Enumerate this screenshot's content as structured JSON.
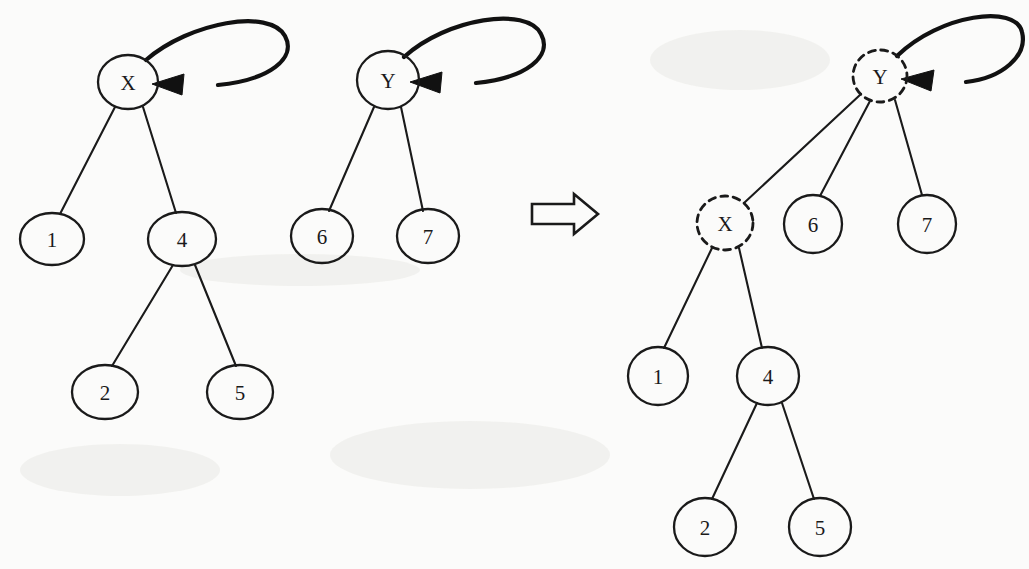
{
  "figure": {
    "background_color": "#fbfbfa",
    "ink_color": "#1a1a1a",
    "transform_symbol": "double-right-arrow"
  },
  "before": {
    "tree_x": {
      "root": "X",
      "root_has_self_loop": true,
      "nodes": [
        {
          "id": "X",
          "label": "X",
          "cx": 128,
          "cy": 82,
          "rx": 30,
          "ry": 27,
          "style": "solid",
          "self_loop": true
        },
        {
          "id": "L1",
          "label": "1",
          "cx": 52,
          "cy": 239,
          "rx": 32,
          "ry": 26,
          "style": "solid",
          "self_loop": false
        },
        {
          "id": "L4",
          "label": "4",
          "cx": 182,
          "cy": 239,
          "rx": 34,
          "ry": 27,
          "style": "solid",
          "self_loop": false
        },
        {
          "id": "L2",
          "label": "2",
          "cx": 105,
          "cy": 392,
          "rx": 33,
          "ry": 27,
          "style": "solid",
          "self_loop": false
        },
        {
          "id": "L5",
          "label": "5",
          "cx": 240,
          "cy": 392,
          "rx": 33,
          "ry": 27,
          "style": "solid",
          "self_loop": false
        }
      ],
      "edges": [
        {
          "from": "X",
          "to": "L1"
        },
        {
          "from": "X",
          "to": "L4"
        },
        {
          "from": "L4",
          "to": "L2"
        },
        {
          "from": "L4",
          "to": "L5"
        }
      ]
    },
    "tree_y": {
      "root": "Y",
      "root_has_self_loop": true,
      "nodes": [
        {
          "id": "Y",
          "label": "Y",
          "cx": 388,
          "cy": 80,
          "rx": 31,
          "ry": 29,
          "style": "solid",
          "self_loop": true
        },
        {
          "id": "L6",
          "label": "6",
          "cx": 322,
          "cy": 236,
          "rx": 31,
          "ry": 27,
          "style": "solid",
          "self_loop": false
        },
        {
          "id": "L7",
          "label": "7",
          "cx": 428,
          "cy": 236,
          "rx": 31,
          "ry": 27,
          "style": "solid",
          "self_loop": false
        }
      ],
      "edges": [
        {
          "from": "Y",
          "to": "L6"
        },
        {
          "from": "Y",
          "to": "L7"
        }
      ]
    }
  },
  "after": {
    "tree_merged": {
      "root": "Y",
      "root_has_self_loop": true,
      "nodes": [
        {
          "id": "Y",
          "label": "Y",
          "cx": 880,
          "cy": 76,
          "rx": 27,
          "ry": 26,
          "style": "dashed",
          "self_loop": true
        },
        {
          "id": "X",
          "label": "X",
          "cx": 725,
          "cy": 223,
          "rx": 28,
          "ry": 27,
          "style": "dashed",
          "self_loop": false
        },
        {
          "id": "R6",
          "label": "6",
          "cx": 813,
          "cy": 224,
          "rx": 29,
          "ry": 29,
          "style": "solid",
          "self_loop": false
        },
        {
          "id": "R7",
          "label": "7",
          "cx": 927,
          "cy": 224,
          "rx": 29,
          "ry": 29,
          "style": "solid",
          "self_loop": false
        },
        {
          "id": "R1",
          "label": "1",
          "cx": 658,
          "cy": 376,
          "rx": 30,
          "ry": 29,
          "style": "solid",
          "self_loop": false
        },
        {
          "id": "R4",
          "label": "4",
          "cx": 768,
          "cy": 376,
          "rx": 31,
          "ry": 29,
          "style": "solid",
          "self_loop": false
        },
        {
          "id": "R2",
          "label": "2",
          "cx": 705,
          "cy": 527,
          "rx": 31,
          "ry": 29,
          "style": "solid",
          "self_loop": false
        },
        {
          "id": "R5",
          "label": "5",
          "cx": 820,
          "cy": 527,
          "rx": 31,
          "ry": 29,
          "style": "solid",
          "self_loop": false
        }
      ],
      "edges": [
        {
          "from": "Y",
          "to": "X"
        },
        {
          "from": "Y",
          "to": "R6"
        },
        {
          "from": "Y",
          "to": "R7"
        },
        {
          "from": "X",
          "to": "R1"
        },
        {
          "from": "X",
          "to": "R4"
        },
        {
          "from": "R4",
          "to": "R2"
        },
        {
          "from": "R4",
          "to": "R5"
        }
      ]
    }
  },
  "labels": {
    "x_root": "X",
    "y_root": "Y",
    "n1": "1",
    "n2": "2",
    "n4": "4",
    "n5": "5",
    "n6": "6",
    "n7": "7"
  }
}
